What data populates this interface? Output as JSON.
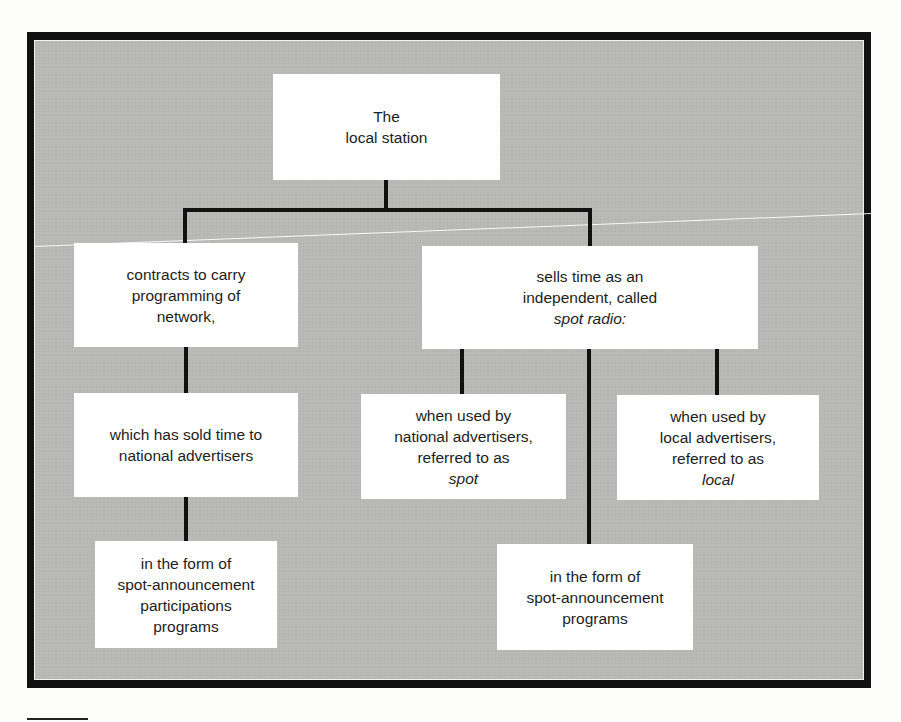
{
  "diagram": {
    "type": "hierarchy-tree",
    "colors": {
      "frame": "#111111",
      "panel_background": "#b8b8b6",
      "box_background": "#ffffff",
      "connector": "#111111",
      "text": "#1d1d1d"
    },
    "root": {
      "lines": [
        "The",
        "local station"
      ]
    },
    "left_branch": {
      "level1": {
        "lines": [
          "contracts to carry",
          "programming of",
          "network,"
        ]
      },
      "level2": {
        "lines": [
          "which has sold time to",
          "national advertisers"
        ]
      },
      "level3": {
        "lines": [
          "in the form of",
          "spot-announcement",
          "participations",
          "programs"
        ]
      }
    },
    "right_branch": {
      "level1": {
        "lines": [
          "sells time as an",
          "independent, called",
          "spot radio:"
        ],
        "italic_line_index": 2
      },
      "national": {
        "lines": [
          "when used by",
          "national advertisers,",
          "referred to as",
          "spot"
        ],
        "italic_line_index": 3
      },
      "programs": {
        "lines": [
          "in the form of",
          "spot-announcement",
          "programs"
        ]
      },
      "local": {
        "lines": [
          "when used by",
          "local advertisers,",
          "referred to as",
          "local"
        ],
        "italic_line_index": 3
      }
    }
  }
}
